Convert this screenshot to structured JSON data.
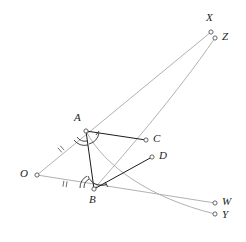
{
  "figure": {
    "background_color": "#ffffff",
    "width": 246,
    "height": 242,
    "stroke_light": "#a8a8a8",
    "stroke_dark": "#1c1c1c",
    "point_fill": "#ffffff",
    "point_stroke": "#555555"
  },
  "points": [
    {
      "id": "O",
      "label": "O",
      "x": 37,
      "y": 175,
      "label_x": 20,
      "label_y": 168,
      "interactable": false
    },
    {
      "id": "A",
      "label": "A",
      "x": 86,
      "y": 131,
      "label_x": 74,
      "label_y": 113,
      "interactable": false
    },
    {
      "id": "B",
      "label": "B",
      "x": 94,
      "y": 189,
      "label_x": 89,
      "label_y": 194,
      "interactable": false
    },
    {
      "id": "C",
      "label": "C",
      "x": 146,
      "y": 140,
      "label_x": 153,
      "label_y": 133,
      "interactable": false
    },
    {
      "id": "D",
      "label": "D",
      "x": 152,
      "y": 157,
      "label_x": 159,
      "label_y": 150,
      "interactable": false
    },
    {
      "id": "X",
      "label": "X",
      "x": 211,
      "y": 32,
      "label_x": 206,
      "label_y": 12,
      "interactable": false
    },
    {
      "id": "Z",
      "label": "Z",
      "x": 215,
      "y": 38,
      "label_x": 222,
      "label_y": 31,
      "interactable": false
    },
    {
      "id": "W",
      "label": "W",
      "x": 215,
      "y": 203,
      "label_x": 222,
      "label_y": 196,
      "interactable": false
    },
    {
      "id": "Y",
      "label": "Y",
      "x": 215,
      "y": 214,
      "label_x": 222,
      "label_y": 208,
      "interactable": false
    }
  ],
  "segments": [
    {
      "id": "O-to-X",
      "from": "O",
      "to": "X",
      "via": "A",
      "style": "light",
      "kind": "ray"
    },
    {
      "id": "O-to-W",
      "from": "O",
      "to": "W",
      "via": "B",
      "style": "light",
      "kind": "ray"
    },
    {
      "id": "A-to-B",
      "from": "A",
      "to": "B",
      "style": "dark",
      "kind": "segment"
    },
    {
      "id": "A-to-C",
      "from": "A",
      "to": "C",
      "style": "dark",
      "kind": "segment"
    },
    {
      "id": "B-to-D",
      "from": "B",
      "to": "D",
      "style": "dark",
      "kind": "segment"
    },
    {
      "id": "B-to-Z",
      "from": "B",
      "to": "Z",
      "style": "light",
      "kind": "curve"
    },
    {
      "id": "A-to-Y",
      "from": "A",
      "to": "Y",
      "style": "light",
      "kind": "curve"
    }
  ],
  "tick_marks": [
    {
      "id": "tick-OA",
      "on_segment": "O-to-A",
      "x": 61,
      "y": 149,
      "glyph": "double-tick",
      "angle": -42
    },
    {
      "id": "tick-OB",
      "on_segment": "O-to-B",
      "x": 65,
      "y": 184,
      "glyph": "double-tick",
      "angle": 13
    }
  ],
  "angle_marks": [
    {
      "id": "angle-at-A-OAB",
      "vertex": "A",
      "style": "double-arc",
      "note": "arcs on left side of A between ray AO and AB"
    },
    {
      "id": "angle-at-A-BAC",
      "vertex": "A",
      "style": "single-arc-tick",
      "note": "arc with tick on right side of A between AB and AC"
    },
    {
      "id": "angle-at-B-ABO",
      "vertex": "B",
      "style": "double-arc",
      "note": "arcs on left side of B between BA and BO"
    },
    {
      "id": "angle-at-B-ABD",
      "vertex": "B",
      "style": "single-arc-tick",
      "note": "arc with tick on right side of B between BA and BD"
    }
  ]
}
